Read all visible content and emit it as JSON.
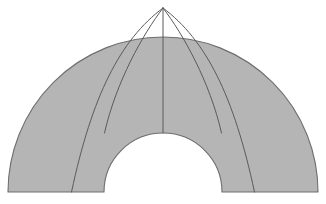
{
  "figure": {
    "type": "geometric-diagram",
    "canvas": {
      "width": 326,
      "height": 204,
      "background": "#ffffff"
    },
    "style": {
      "fill_color": "#b5b5b5",
      "outline_color": "#6e6e6e",
      "divider_color": "#5a5a5a",
      "outline_width": 1.1,
      "divider_width": 1.0
    },
    "geometry": {
      "center_x": 163,
      "baseline_y": 192,
      "outer_radius": 155,
      "inner_radius": 59,
      "apex_x": 163,
      "apex_y": 8,
      "start_angle_deg": 180,
      "end_angle_deg": 0
    },
    "outer_arc": {
      "left_x": 8,
      "right_x": 318,
      "top_y": 37
    },
    "inner_arc": {
      "left_x": 104,
      "right_x": 222,
      "top_y": 133
    },
    "dividers": [
      {
        "name": "divider-left-outer",
        "bottom_x": 71,
        "bottom_y": 192,
        "label": "1"
      },
      {
        "name": "divider-left-inner",
        "bottom_x": 104,
        "bottom_y": 133,
        "label": "2"
      },
      {
        "name": "divider-center",
        "bottom_x": 163,
        "bottom_y": 133,
        "label": "3"
      },
      {
        "name": "divider-right-inner",
        "bottom_x": 222,
        "bottom_y": 133,
        "label": "4"
      },
      {
        "name": "divider-right-outer",
        "bottom_x": 254,
        "bottom_y": 192,
        "label": "5"
      }
    ],
    "paths": {
      "body": "M 8 192 L 8 192 A 155 155 0 0 1 318 192 L 318 192 L 222 192 A 59 59 0 0 0 104 192 L 104 192 Z",
      "divider_left_outer": "M 163 8 C 120 40 92 96 71.5 192",
      "divider_left_inner": "M 163 8 C 143 34 116 82 104.5 133",
      "divider_center": "M 163 8 L 163 133",
      "divider_right_inner": "M 163 8 C 183 34 210 82 221.5 133",
      "divider_right_outer": "M 163 8 C 206 40 234 96 254.5 192"
    }
  }
}
